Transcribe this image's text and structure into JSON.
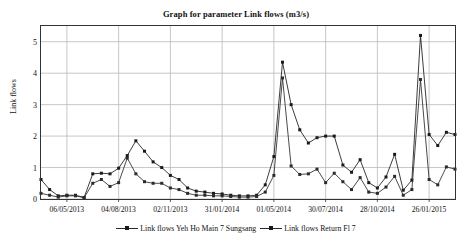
{
  "chart_data": {
    "type": "line",
    "title": "Graph for parameter Link flows (m3/s)",
    "xlabel": "",
    "ylabel": "Link flows",
    "ylim": [
      0,
      5.5
    ],
    "yticks": [
      0,
      1,
      2,
      3,
      4,
      5
    ],
    "ytick_labels": [
      "0",
      "1",
      "2",
      "3",
      "4",
      "5"
    ],
    "grid": true,
    "legend_position": "bottom",
    "xtick_labels": [
      "06/05/2013",
      "04/08/2013",
      "02/11/2013",
      "31/01/2014",
      "01/05/2014",
      "30/07/2014",
      "28/10/2014",
      "26/01/2015"
    ],
    "xtick_indices": [
      3,
      9,
      15,
      21,
      27,
      33,
      39,
      45
    ],
    "x_count": 49,
    "series": [
      {
        "name": "Link flows Yeh Ho Main 7 Sungsang",
        "color": "#1a1a1a",
        "marker": "square",
        "values": [
          0.62,
          0.3,
          0.1,
          0.12,
          0.12,
          0.05,
          0.8,
          0.82,
          0.8,
          0.98,
          1.38,
          1.85,
          1.52,
          1.18,
          1.0,
          0.75,
          0.62,
          0.35,
          0.25,
          0.22,
          0.18,
          0.16,
          0.12,
          0.1,
          0.1,
          0.12,
          0.45,
          1.35,
          4.35,
          3.0,
          2.2,
          1.78,
          1.95,
          2.0,
          2.0,
          1.08,
          0.85,
          1.25,
          0.52,
          0.35,
          0.7,
          1.42,
          0.28,
          0.6,
          5.2,
          2.05,
          1.7,
          2.12,
          2.05
        ]
      },
      {
        "name": "Link flows Return Fl 7",
        "color": "#2b2b2b",
        "marker": "square",
        "values": [
          0.18,
          0.12,
          0.06,
          0.1,
          0.1,
          0.04,
          0.5,
          0.62,
          0.4,
          0.52,
          1.3,
          0.8,
          0.55,
          0.5,
          0.5,
          0.35,
          0.3,
          0.18,
          0.12,
          0.12,
          0.1,
          0.1,
          0.08,
          0.06,
          0.06,
          0.08,
          0.22,
          0.75,
          3.85,
          1.05,
          0.78,
          0.8,
          0.95,
          0.52,
          0.82,
          0.55,
          0.3,
          0.68,
          0.22,
          0.18,
          0.38,
          0.72,
          0.12,
          0.3,
          3.8,
          0.62,
          0.45,
          1.02,
          0.95
        ]
      }
    ]
  },
  "legend": {
    "items": [
      {
        "label": "Link flows Yeh Ho Main 7 Sungsang"
      },
      {
        "label": "Link flows Return Fl 7"
      }
    ]
  }
}
